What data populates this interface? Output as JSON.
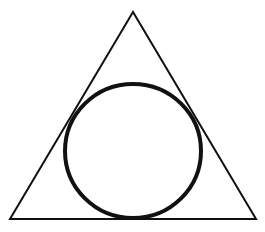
{
  "diagram": {
    "background": "#ffffff",
    "stroke_color": "#111111",
    "triangle": {
      "points": "133,12 10,219 256,219",
      "stroke_width": 2
    },
    "circle": {
      "cx": 133,
      "cy": 151,
      "rx": 68,
      "ry": 67,
      "stroke_width": 4
    }
  }
}
